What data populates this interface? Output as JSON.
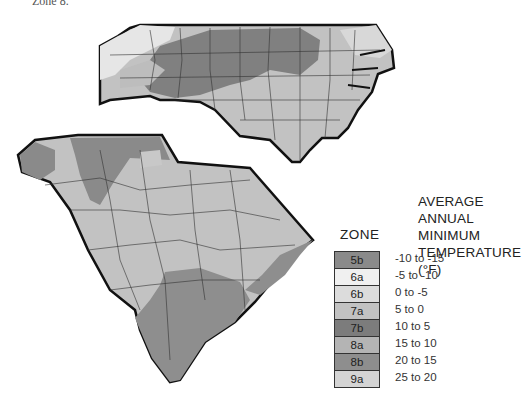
{
  "caption": "Zone 8.",
  "legend": {
    "zone_header": "ZONE",
    "temp_header_lines": [
      "AVERAGE",
      "ANNUAL MINIMUM",
      "TEMPERATURE (°F)"
    ],
    "items": [
      {
        "zone": "5b",
        "range": "-10 to -15",
        "color": "#8a8a8a"
      },
      {
        "zone": "6a",
        "range": "-5 to -10",
        "color": "#f0f0f0"
      },
      {
        "zone": "6b",
        "range": "0 to -5",
        "color": "#dcdcdc"
      },
      {
        "zone": "7a",
        "range": "5 to 0",
        "color": "#c2c2c2"
      },
      {
        "zone": "7b",
        "range": "10 to 5",
        "color": "#7c7c7c"
      },
      {
        "zone": "8a",
        "range": "15 to 10",
        "color": "#b4b4b4"
      },
      {
        "zone": "8b",
        "range": "20 to 15",
        "color": "#8e8e8e"
      },
      {
        "zone": "9a",
        "range": "25 to 20",
        "color": "#d4d4d4"
      }
    ]
  },
  "maps": [
    {
      "name": "North Carolina"
    },
    {
      "name": "South Carolina"
    }
  ]
}
